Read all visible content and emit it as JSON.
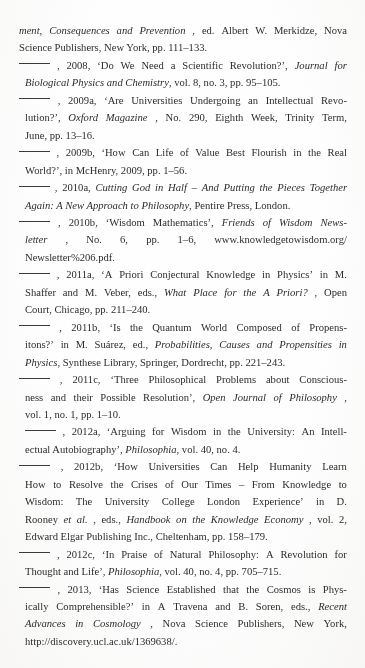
{
  "page": {
    "kind": "scanned-bibliography-page",
    "background_color": "#fefefe",
    "text_color": "#2e2c2b",
    "rule_glyph": "______",
    "note": "Bibliography continuation page; repeated author replaced by a long dash rule."
  },
  "entries": [
    {
      "id": "entry-continuation",
      "has_rule": false,
      "lines": [
        [
          {
            "t": "ment, Consequences and Prevention",
            "i": true
          },
          {
            "t": ", ed. Albert W. Merkidze, Nova",
            "i": false
          }
        ],
        [
          {
            "t": "Science Publishers, New York, pp. 111–133.",
            "i": false
          }
        ]
      ]
    },
    {
      "id": "entry-2008",
      "has_rule": true,
      "year": "2008",
      "lines": [
        [
          {
            "t": ", 2008, ‘Do We Need a Scientific Revolution?’, ",
            "i": false
          },
          {
            "t": "Journal for",
            "i": true
          }
        ],
        [
          {
            "t": "Biological Physics and Chemistry",
            "i": true
          },
          {
            "t": ", vol. 8, no. 3, pp. 95–105.",
            "i": false
          }
        ]
      ]
    },
    {
      "id": "entry-2009a",
      "has_rule": true,
      "year": "2009a",
      "lines": [
        [
          {
            "t": ", 2009a, ‘Are Universities Undergoing an Intellectual Revo-",
            "i": false
          }
        ],
        [
          {
            "t": "lution?’, ",
            "i": false
          },
          {
            "t": "Oxford Magazine",
            "i": true
          },
          {
            "t": ", No. 290, Eighth Week, Trinity Term,",
            "i": false
          }
        ],
        [
          {
            "t": "June, pp. 13–16.",
            "i": false
          }
        ]
      ]
    },
    {
      "id": "entry-2009b",
      "has_rule": true,
      "year": "2009b",
      "lines": [
        [
          {
            "t": ", 2009b, ‘How Can Life of Value Best Flourish in the Real",
            "i": false
          }
        ],
        [
          {
            "t": "World?’, in McHenry, 2009, pp. 1–56.",
            "i": false
          }
        ]
      ]
    },
    {
      "id": "entry-2010a",
      "has_rule": true,
      "year": "2010a",
      "lines": [
        [
          {
            "t": ", 2010a, ",
            "i": false
          },
          {
            "t": "Cutting God in Half – And Putting the Pieces Together",
            "i": true
          }
        ],
        [
          {
            "t": "Again: A New Approach to Philosophy",
            "i": true
          },
          {
            "t": ", Pentire Press, London.",
            "i": false
          }
        ]
      ]
    },
    {
      "id": "entry-2010b",
      "has_rule": true,
      "year": "2010b",
      "lines": [
        [
          {
            "t": ", 2010b, ‘Wisdom Mathematics’, ",
            "i": false
          },
          {
            "t": "Friends of Wisdom News-",
            "i": true
          }
        ],
        [
          {
            "t": "letter",
            "i": true
          },
          {
            "t": ", No. 6, pp. 1–6, www.knowledgetowisdom.org/",
            "i": false
          }
        ],
        [
          {
            "t": "Newsletter%206.pdf.",
            "i": false
          }
        ]
      ]
    },
    {
      "id": "entry-2011a",
      "has_rule": true,
      "year": "2011a",
      "lines": [
        [
          {
            "t": ", 2011a, ‘A Priori Conjectural Knowledge in Physics’ in M.",
            "i": false
          }
        ],
        [
          {
            "t": "Shaffer and M. Veber, eds., ",
            "i": false
          },
          {
            "t": "What Place for the A Priori?",
            "i": true
          },
          {
            "t": ", Open",
            "i": false
          }
        ],
        [
          {
            "t": "Court, Chicago, pp. 211–240.",
            "i": false
          }
        ]
      ]
    },
    {
      "id": "entry-2011b",
      "has_rule": true,
      "year": "2011b",
      "lines": [
        [
          {
            "t": ", 2011b, ‘Is the Quantum World Composed of Propens-",
            "i": false
          }
        ],
        [
          {
            "t": "itons?’ in M. Suárez, ed., ",
            "i": false
          },
          {
            "t": "Probabilities, Causes and Propensities in",
            "i": true
          }
        ],
        [
          {
            "t": "Physics",
            "i": true
          },
          {
            "t": ", Synthese Library, Springer, Dordrecht, pp. 221–243.",
            "i": false
          }
        ]
      ]
    },
    {
      "id": "entry-2011c",
      "has_rule": true,
      "year": "2011c",
      "lines": [
        [
          {
            "t": ", 2011c, ‘Three Philosophical Problems about Conscious-",
            "i": false
          }
        ],
        [
          {
            "t": "ness and their Possible Resolution’, ",
            "i": false
          },
          {
            "t": "Open Journal of Philosophy",
            "i": true
          },
          {
            "t": ",",
            "i": false
          }
        ],
        [
          {
            "t": "vol. 1, no. 1, pp. 1–10.",
            "i": false
          }
        ]
      ]
    },
    {
      "id": "entry-2012a",
      "has_rule": true,
      "rule_indent": true,
      "year": "2012a",
      "lines": [
        [
          {
            "t": ", 2012a, ‘Arguing for Wisdom in the University: An Intell-",
            "i": false
          }
        ],
        [
          {
            "t": "ectual Autobiography’, ",
            "i": false
          },
          {
            "t": "Philosophia",
            "i": true
          },
          {
            "t": ", vol. 40, no. 4.",
            "i": false
          }
        ]
      ]
    },
    {
      "id": "entry-2012b",
      "has_rule": true,
      "year": "2012b",
      "lines": [
        [
          {
            "t": ", 2012b, ‘How Universities Can Help Humanity Learn",
            "i": false
          }
        ],
        [
          {
            "t": "How to Resolve the Crises of Our Times – From Knowledge to",
            "i": false
          }
        ],
        [
          {
            "t": "Wisdom: The University College London Experience’ in D.",
            "i": false
          }
        ],
        [
          {
            "t": "Rooney ",
            "i": false
          },
          {
            "t": "et al.",
            "i": true
          },
          {
            "t": ", eds., ",
            "i": false
          },
          {
            "t": "Handbook on the Knowledge Economy",
            "i": true
          },
          {
            "t": ", vol. 2,",
            "i": false
          }
        ],
        [
          {
            "t": "Edward Elgar Publishing Inc., Cheltenham, pp. 158–179.",
            "i": false
          }
        ]
      ]
    },
    {
      "id": "entry-2012c",
      "has_rule": true,
      "year": "2012c",
      "lines": [
        [
          {
            "t": ", 2012c, ‘In Praise of Natural Philosophy: A Revolution for",
            "i": false
          }
        ],
        [
          {
            "t": "Thought and Life’, ",
            "i": false
          },
          {
            "t": "Philosophia",
            "i": true
          },
          {
            "t": ", vol. 40, no. 4, pp. 705–715.",
            "i": false
          }
        ]
      ]
    },
    {
      "id": "entry-2013",
      "has_rule": true,
      "year": "2013",
      "lines": [
        [
          {
            "t": ", 2013, ‘Has Science Established that the Cosmos is Phys-",
            "i": false
          }
        ],
        [
          {
            "t": "ically Comprehensible?’ in A Travena and B. Soren, eds., ",
            "i": false
          },
          {
            "t": "Recent",
            "i": true
          }
        ],
        [
          {
            "t": "Advances in Cosmology",
            "i": true
          },
          {
            "t": ", Nova Science Publishers, New York,",
            "i": false
          }
        ],
        [
          {
            "t": "http://discovery.ucl.ac.uk/1369638/.",
            "i": false
          }
        ]
      ]
    }
  ]
}
